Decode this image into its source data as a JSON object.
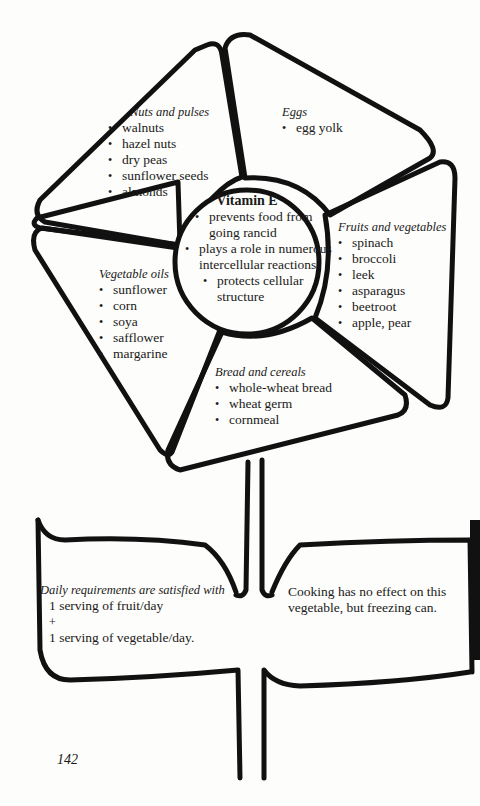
{
  "center": {
    "title": "Vitamin E",
    "items": [
      "prevents food from going rancid",
      "plays a role in numerous intercellular reactions",
      "protects cellular structure"
    ]
  },
  "petals": {
    "nuts": {
      "header": "Nuts and pulses",
      "items": [
        "walnuts",
        "hazel nuts",
        "dry peas",
        "sunflower seeds",
        "almonds"
      ]
    },
    "eggs": {
      "header": "Eggs",
      "items": [
        "egg yolk"
      ]
    },
    "fruits": {
      "header": "Fruits and vegetables",
      "items": [
        "spinach",
        "broccoli",
        "leek",
        "asparagus",
        "beetroot",
        "apple, pear"
      ]
    },
    "oils": {
      "header": "Vegetable oils",
      "items": [
        "sunflower",
        "corn",
        "soya",
        "safflower",
        "margarine"
      ]
    },
    "bread": {
      "header": "Bread and cereals",
      "items": [
        "whole-wheat bread",
        "wheat germ",
        "cornmeal"
      ]
    }
  },
  "leaves": {
    "left": {
      "header": "Daily requirements are satisfied with",
      "line1": "1 serving of fruit/day",
      "plus": "+",
      "line2": "1 serving of vegetable/day."
    },
    "right": {
      "text": "Cooking has no effect on this vegetable, but freezing can."
    }
  },
  "page_number": "142",
  "colors": {
    "ink": "#111111",
    "paper": "#fdfdfb"
  }
}
